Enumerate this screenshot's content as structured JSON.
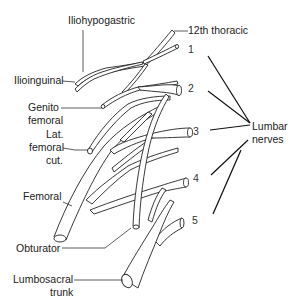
{
  "diagram": {
    "branch_labels": {
      "iliohypogastric": "Iliohypogastric",
      "ilioinguinal": "Ilioinguinal",
      "genitofemoral_1": "Genito",
      "genitofemoral_2": "femoral",
      "lat_femoral_cut_1": "Lat.",
      "lat_femoral_cut_2": "femoral",
      "lat_femoral_cut_3": "cut.",
      "femoral": "Femoral",
      "obturator": "Obturator",
      "lumbosacral_1": "Lumbosacral",
      "lumbosacral_2": "trunk"
    },
    "root_labels": {
      "thoracic12": "12th thoracic",
      "l1": "1",
      "l2": "2",
      "l3": "3",
      "l4": "4",
      "l5": "5"
    },
    "group_label": {
      "line1": "Lumbar",
      "line2": "nerves"
    },
    "colors": {
      "line": "#222222",
      "background": "#ffffff"
    }
  }
}
